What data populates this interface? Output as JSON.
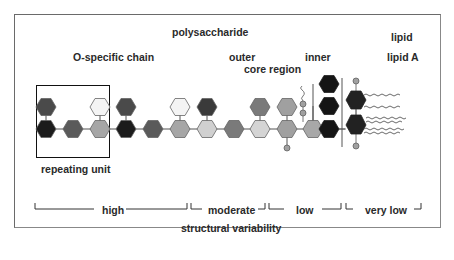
{
  "labels": {
    "polysaccharide": "polysaccharide",
    "o_specific_chain": "O-specific chain",
    "outer": "outer",
    "core_region": "core region",
    "inner": "inner",
    "lipid": "lipid",
    "lipid_a": "lipid A",
    "repeating_unit": "repeating unit",
    "structural_variability": "structural variability"
  },
  "variability_scale": [
    {
      "label": "high"
    },
    {
      "label": "moderate"
    },
    {
      "label": "low"
    },
    {
      "label": "very low"
    }
  ],
  "colors": {
    "black": "#1c1c1c",
    "dark_gray": "#4a4a4a",
    "mid_gray": "#6e6e6e",
    "light_gray": "#a8a8a8",
    "pale_gray": "#d2d2d2",
    "white": "#f4f4f4",
    "outline": "#555555"
  }
}
